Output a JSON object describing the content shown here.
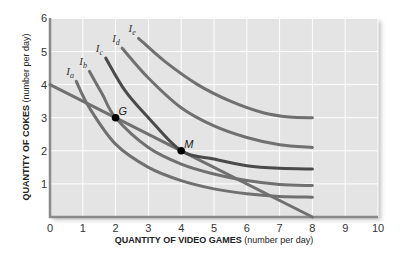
{
  "chart_data": {
    "type": "line",
    "title": "",
    "xlabel": "QUANTITY OF VIDEO GAMES",
    "xlabel_unit": "(number per day)",
    "ylabel": "QUANTITY OF COKES",
    "ylabel_unit": "(number per day)",
    "xlim": [
      0,
      10
    ],
    "ylim": [
      0,
      6
    ],
    "x_ticks": [
      "0",
      "1",
      "2",
      "3",
      "4",
      "5",
      "6",
      "7",
      "8",
      "9",
      "10"
    ],
    "y_ticks": [
      "1",
      "2",
      "3",
      "4",
      "5",
      "6"
    ],
    "grid": true,
    "colors": {
      "background": "#e4e4e4",
      "grid": "#ffffff",
      "curve": "#707070",
      "curve_dark": "#4a4a4a",
      "point": "#000000"
    },
    "series": [
      {
        "name": "budget",
        "label": "",
        "points": [
          [
            0,
            4
          ],
          [
            8,
            0
          ]
        ]
      },
      {
        "name": "Ia",
        "label": "I",
        "sub": "a",
        "points": [
          [
            0.8,
            4.1
          ],
          [
            1.2,
            3.3
          ],
          [
            2,
            2.2
          ],
          [
            3,
            1.5
          ],
          [
            4,
            1.1
          ],
          [
            5,
            0.85
          ],
          [
            6,
            0.7
          ],
          [
            7,
            0.62
          ],
          [
            8,
            0.6
          ]
        ]
      },
      {
        "name": "Ib",
        "label": "I",
        "sub": "b",
        "points": [
          [
            1.2,
            4.4
          ],
          [
            1.6,
            3.7
          ],
          [
            2,
            3.0
          ],
          [
            3,
            2.1
          ],
          [
            4,
            1.6
          ],
          [
            5,
            1.3
          ],
          [
            6,
            1.1
          ],
          [
            7,
            0.98
          ],
          [
            8,
            0.95
          ]
        ]
      },
      {
        "name": "Ic",
        "label": "I",
        "sub": "c",
        "points": [
          [
            1.7,
            4.8
          ],
          [
            2.3,
            3.8
          ],
          [
            3,
            3.0
          ],
          [
            4,
            2.0
          ],
          [
            5,
            1.75
          ],
          [
            6,
            1.55
          ],
          [
            7,
            1.47
          ],
          [
            8,
            1.45
          ]
        ]
      },
      {
        "name": "Id",
        "label": "I",
        "sub": "d",
        "points": [
          [
            2.2,
            5.1
          ],
          [
            3,
            4.2
          ],
          [
            4,
            3.3
          ],
          [
            5,
            2.75
          ],
          [
            6,
            2.4
          ],
          [
            7,
            2.18
          ],
          [
            8,
            2.1
          ]
        ]
      },
      {
        "name": "Ie",
        "label": "I",
        "sub": "e",
        "points": [
          [
            2.7,
            5.4
          ],
          [
            3.5,
            4.7
          ],
          [
            4.5,
            4.0
          ],
          [
            5.5,
            3.5
          ],
          [
            6.5,
            3.15
          ],
          [
            7.3,
            3.02
          ],
          [
            8,
            3.0
          ]
        ]
      }
    ],
    "points": [
      {
        "label": "G",
        "x": 2,
        "y": 3
      },
      {
        "label": "M",
        "x": 4,
        "y": 2
      }
    ]
  }
}
